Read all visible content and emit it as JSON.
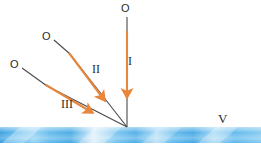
{
  "figure": {
    "type": "optics-ray-diagram",
    "background_color": "#ffffff",
    "surface": {
      "name": "reflective-surface-band",
      "color_dark": "#3aa0e0",
      "color_mid": "#62bdef",
      "color_light": "#dff0fb",
      "y_top": 127,
      "y_bottom": 143
    },
    "convergence_point": {
      "x": 127,
      "y": 127
    },
    "ray_color": "#e8873c",
    "line_color": "#4a4a4a",
    "rays": [
      {
        "id": "ray-1",
        "label": "I",
        "label_x": 128,
        "label_y": 56,
        "origin_label": "O",
        "origin_label_x": 121,
        "origin_label_y": 3,
        "start_x": 127,
        "start_y": 17,
        "dark_end_x": 127,
        "dark_end_y": 31,
        "arrow_tip_x": 127,
        "arrow_tip_y": 101
      },
      {
        "id": "ray-2",
        "label": "II",
        "label_x": 92,
        "label_y": 64,
        "origin_label": "O",
        "origin_label_x": 42,
        "origin_label_y": 31,
        "start_x": 54,
        "start_y": 40,
        "dark_end_x": 69,
        "dark_end_y": 53,
        "arrow_tip_x": 108,
        "arrow_tip_y": 104
      },
      {
        "id": "ray-3",
        "label": "III",
        "label_x": 61,
        "label_y": 99,
        "origin_label": "O",
        "origin_label_x": 10,
        "origin_label_y": 59,
        "start_x": 22,
        "start_y": 68,
        "dark_end_x": 46,
        "dark_end_y": 85,
        "arrow_tip_x": 96,
        "arrow_tip_y": 115
      }
    ],
    "surface_label": {
      "text": "V",
      "x": 218,
      "y": 113
    },
    "credit": "Marco A. Sismotto"
  }
}
